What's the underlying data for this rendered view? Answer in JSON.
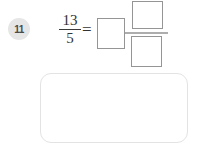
{
  "question": {
    "number": "11",
    "improper_fraction": {
      "numerator": "13",
      "denominator": "5"
    },
    "equals": "=",
    "answer_boxes": {
      "whole": "",
      "numerator": "",
      "denominator": ""
    }
  },
  "colors": {
    "input_box_border": "#959595",
    "answer_fraction_bar": "#adadad",
    "math_text": "#333333",
    "badge_background": "#e6e6e6",
    "badge_text": "#4a4a4a",
    "work_area_border": "#e3e3e3",
    "background": "#ffffff"
  }
}
